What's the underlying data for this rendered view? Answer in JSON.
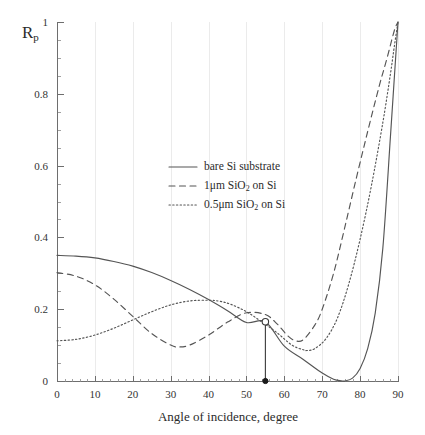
{
  "chart_data": {
    "type": "line",
    "title": "",
    "xlabel": "Angle of incidence, degree",
    "ylabel": "Rp",
    "ylabel_base": "R",
    "ylabel_sub": "p",
    "xlim": [
      0,
      90
    ],
    "ylim": [
      0,
      1
    ],
    "xticks": [
      0,
      10,
      20,
      30,
      40,
      50,
      60,
      70,
      80,
      90
    ],
    "xtick_labels": [
      "0",
      "10",
      "20",
      "30",
      "40",
      "50",
      "60",
      "70",
      "80",
      "90"
    ],
    "yticks": [
      0,
      0.2,
      0.4,
      0.6,
      0.8,
      1
    ],
    "ytick_labels": [
      "0",
      "0.2",
      "0.4",
      "0.6",
      "0.8",
      "1"
    ],
    "x_minor_step": 2,
    "y_minor_step": 0.05,
    "grid": "vertical-major-only",
    "legend_position": "upper-center-inside",
    "series": [
      {
        "name": "bare Si substrate",
        "style": "solid",
        "color": "#555555",
        "x": [
          0,
          5,
          10,
          15,
          20,
          25,
          30,
          35,
          40,
          45,
          50,
          55,
          60,
          65,
          70,
          73,
          75,
          76,
          78,
          80,
          82,
          84,
          86,
          88,
          89,
          90
        ],
        "y": [
          0.35,
          0.348,
          0.343,
          0.333,
          0.32,
          0.302,
          0.28,
          0.255,
          0.227,
          0.196,
          0.163,
          0.165,
          0.097,
          0.06,
          0.022,
          0.005,
          0.0005,
          0.0,
          0.008,
          0.035,
          0.09,
          0.19,
          0.37,
          0.68,
          0.84,
          1.0
        ]
      },
      {
        "name": "1μm SiO₂ on Si",
        "label_base": "1μm SiO",
        "label_sub": "2",
        "label_tail": " on Si",
        "style": "dashed",
        "color": "#555555",
        "x": [
          0,
          5,
          10,
          15,
          20,
          25,
          30,
          32,
          35,
          40,
          45,
          50,
          55,
          58,
          61,
          63,
          65,
          68,
          70,
          73,
          76,
          79,
          82,
          85,
          87,
          89,
          90
        ],
        "y": [
          0.302,
          0.292,
          0.268,
          0.228,
          0.18,
          0.132,
          0.1,
          0.095,
          0.1,
          0.128,
          0.164,
          0.19,
          0.185,
          0.16,
          0.125,
          0.112,
          0.115,
          0.155,
          0.2,
          0.3,
          0.43,
          0.565,
          0.695,
          0.82,
          0.895,
          0.975,
          1.0
        ]
      },
      {
        "name": "0.5μm SiO₂ on Si",
        "label_base": "0.5μm SiO",
        "label_sub": "2",
        "label_tail": " on Si",
        "style": "dotted",
        "color": "#555555",
        "x": [
          0,
          5,
          10,
          15,
          20,
          25,
          30,
          35,
          40,
          43,
          46,
          50,
          54,
          58,
          62,
          65,
          66,
          68,
          71,
          74,
          77,
          80,
          83,
          86,
          88,
          89,
          90
        ],
        "y": [
          0.112,
          0.116,
          0.128,
          0.147,
          0.17,
          0.193,
          0.212,
          0.223,
          0.225,
          0.222,
          0.213,
          0.193,
          0.165,
          0.135,
          0.1,
          0.087,
          0.085,
          0.09,
          0.118,
          0.175,
          0.27,
          0.395,
          0.545,
          0.72,
          0.855,
          0.93,
          1.0
        ]
      }
    ],
    "annotations": [
      {
        "name": "brewster-marker",
        "type": "point-with-dropline",
        "x": 55,
        "y": 0.165,
        "marker": "open-circle",
        "base_marker": "filled-circle",
        "base_y": 0
      }
    ]
  },
  "legend": {
    "items": [
      {
        "sample": "solid-line-sample",
        "label": "bare Si substrate"
      },
      {
        "sample": "dashed-line-sample",
        "label": "1μm SiO₂ on Si"
      },
      {
        "sample": "dotted-line-sample",
        "label": "0.5μm SiO₂ on Si"
      }
    ]
  }
}
